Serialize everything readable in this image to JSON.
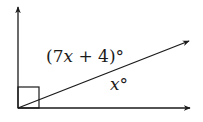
{
  "diagram": {
    "type": "angle-diagram",
    "rays": [
      {
        "name": "vertical-ray",
        "direction": "up"
      },
      {
        "name": "diagonal-ray",
        "direction": "up-right"
      },
      {
        "name": "horizontal-ray",
        "direction": "right"
      }
    ],
    "right_angle_marker": true,
    "labels": {
      "upper_angle_prefix": "(7",
      "upper_angle_var": "x",
      "upper_angle_suffix": " + 4)°",
      "lower_angle_var": "x",
      "lower_angle_suffix": "°"
    },
    "colors": {
      "stroke": "#1a1a1a",
      "background": "#ffffff"
    }
  }
}
